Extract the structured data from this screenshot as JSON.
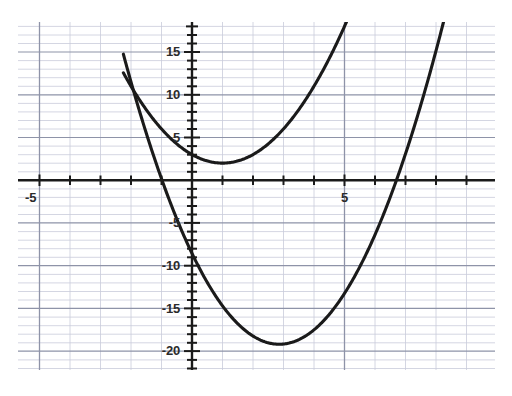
{
  "chart_data": {
    "type": "line",
    "title": "",
    "subtitle": "",
    "xlabel": "",
    "ylabel": "",
    "xlim": [
      -5.7,
      9.9
    ],
    "ylim": [
      -21.6,
      19.3
    ],
    "grid": true,
    "grid_minor": true,
    "legend": "none",
    "axis_color": "#1a1a1a",
    "grid_major_color": "#8e93a8",
    "grid_minor_color": "#c9ccda",
    "curve_color": "#1a1a1a",
    "background": "#ffffff",
    "x_ticks_major": [
      -5,
      0,
      5
    ],
    "x_tick_labels": [
      "-5",
      "",
      "5"
    ],
    "y_ticks_major": [
      -20,
      -15,
      -10,
      -5,
      0,
      5,
      10,
      15
    ],
    "y_tick_labels": [
      "-20",
      "-15",
      "-10",
      "-5",
      "",
      "5",
      "10",
      "15"
    ],
    "x_tick_step_minor": 1,
    "y_tick_step_minor": 1,
    "series": [
      {
        "name": "upper-parabola",
        "type": "quadratic",
        "a": 1.0,
        "h": 1.0,
        "k": 2.0,
        "y_intercept": 3.0,
        "vertex": [
          1.0,
          2.0
        ],
        "roots": [],
        "x_range": [
          -2.25,
          9.9
        ]
      },
      {
        "name": "lower-parabola",
        "type": "quadratic",
        "a": 1.3,
        "h": 2.86,
        "k": -19.2,
        "y_intercept": -9.6,
        "vertex": [
          2.86,
          -19.2
        ],
        "roots": [
          -0.98,
          6.7
        ],
        "x_range": [
          -2.25,
          9.9
        ]
      }
    ],
    "annotations": []
  },
  "axis_labels": {
    "x_neg5": "-5",
    "x_pos5": "5",
    "y_15": "15",
    "y_10": "10",
    "y_5": "5",
    "y_neg5": "-5",
    "y_neg10": "-10",
    "y_neg15": "-15",
    "y_neg20": "-20"
  }
}
